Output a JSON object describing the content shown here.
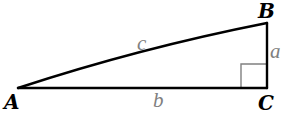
{
  "diagram": {
    "type": "right-triangle",
    "colors": {
      "edge": "#000000",
      "right_angle_marker": "#808080",
      "vertex_label": "#000000",
      "side_label": "#808080",
      "background": "#ffffff"
    },
    "vertices": [
      {
        "id": "A",
        "label": "A",
        "x": 18,
        "y": 88
      },
      {
        "id": "B",
        "label": "B",
        "x": 267,
        "y": 23
      },
      {
        "id": "C",
        "label": "C",
        "x": 267,
        "y": 88
      }
    ],
    "sides": [
      {
        "id": "a",
        "label": "a",
        "from": "B",
        "to": "C",
        "role": "leg"
      },
      {
        "id": "b",
        "label": "b",
        "from": "A",
        "to": "C",
        "role": "leg"
      },
      {
        "id": "c",
        "label": "c",
        "from": "A",
        "to": "B",
        "role": "hypotenuse"
      }
    ],
    "right_angle_at": "C"
  }
}
